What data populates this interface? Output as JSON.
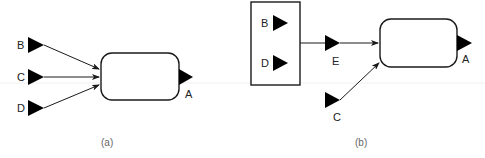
{
  "diagram": {
    "panel_a": {
      "caption": "(a)",
      "inputs": [
        {
          "label": "B"
        },
        {
          "label": "C"
        },
        {
          "label": "D"
        }
      ],
      "output": {
        "label": "A"
      }
    },
    "panel_b": {
      "caption": "(b)",
      "group_ports": [
        {
          "label": "B"
        },
        {
          "label": "D"
        }
      ],
      "intermediate": {
        "label": "E"
      },
      "extra_input": {
        "label": "C"
      },
      "output": {
        "label": "A"
      }
    },
    "colors": {
      "stroke": "#1a1a1a",
      "port_fill": "#000000",
      "caption": "#666666",
      "artifact_line": "#eeeeee"
    }
  }
}
